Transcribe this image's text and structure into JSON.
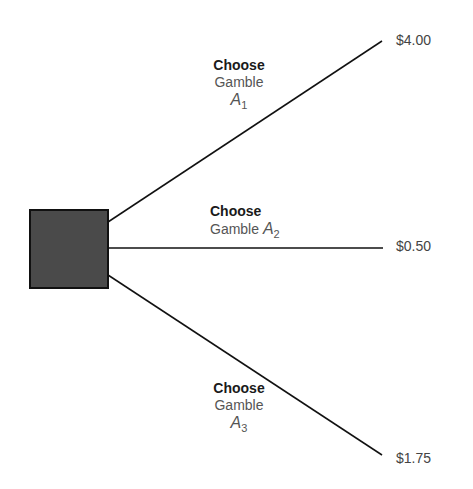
{
  "diagram": {
    "type": "decision-tree",
    "decision_node": {
      "shape": "square",
      "fill": "#4a4a4a"
    },
    "branches": [
      {
        "label_line1": "Choose",
        "label_line2": "Gamble",
        "var": "A",
        "sub": "1",
        "payoff": "$4.00"
      },
      {
        "label_line1": "Choose",
        "label_line2": "Gamble",
        "var": "A",
        "sub": "2",
        "payoff": "$0.50"
      },
      {
        "label_line1": "Choose",
        "label_line2": "Gamble",
        "var": "A",
        "sub": "3",
        "payoff": "$1.75"
      }
    ]
  }
}
